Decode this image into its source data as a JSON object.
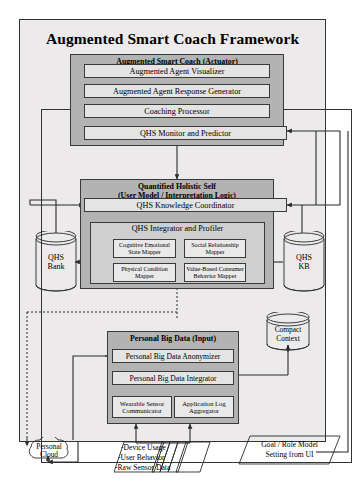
{
  "title": "Augmented Smart Coach Framework",
  "actuator": {
    "group_title": "Augmented Smart Coach (Actuator)",
    "boxes": [
      {
        "label": "Augmented Agent Visualizer"
      },
      {
        "label": "Augmented Agent Response Generator"
      },
      {
        "label": "Coaching Processor"
      },
      {
        "label": "QHS Monitor and Predictor"
      }
    ]
  },
  "qhs": {
    "group_title_line1": "Quantified Holistic Self",
    "group_title_line2": "(User Model / Interpretation Logic)",
    "coordinator": "QHS Knowledge Coordinator",
    "profiler_title": "QHS Integrator and Profiler",
    "mappers": [
      {
        "line1": "Cognitive Emotional",
        "line2": "State Mapper"
      },
      {
        "line1": "Social Relationship",
        "line2": "Mapper"
      },
      {
        "line1": "Physical Condition",
        "line2": "Mapper"
      },
      {
        "line1": "Value-Based Consumer",
        "line2": "Behavior Mapper"
      }
    ]
  },
  "bigdata": {
    "group_title": "Personal Big Data (Input)",
    "anonymizer": "Personal Big Data Anonymizer",
    "integrator": "Personal Big Data Integrator",
    "sources": [
      {
        "line1": "Wearable Sensor",
        "line2": "Communicator"
      },
      {
        "line1": "Application Log",
        "line2": "Aggregator"
      }
    ]
  },
  "stores": {
    "qhs_bank_line1": "QHS",
    "qhs_bank_line2": "Bank",
    "qhs_kb_line1": "QHS",
    "qhs_kb_line2": "KB",
    "compact_context_line1": "Compact",
    "compact_context_line2": "Context"
  },
  "cloud": {
    "line1": "Personal",
    "line2": "Cloud"
  },
  "inputs": {
    "raw_line1": "-Device Usage",
    "raw_line2": "-User Behavior",
    "raw_line3": "-Raw Sensor Data",
    "goal_line1": "Goal / Role Model",
    "goal_line2": "Setting from UI"
  },
  "colors": {
    "frame_bg": "#eceaea",
    "group_bg": "#b3b3b3",
    "subgroup_bg": "#cfcfcf",
    "box_bg": "#e4e4e4",
    "stroke": "#2b2b2b"
  }
}
